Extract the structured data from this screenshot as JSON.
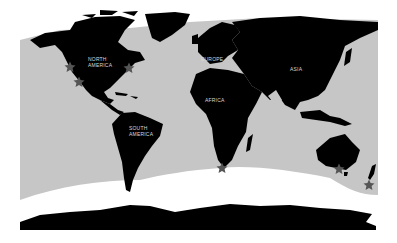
{
  "map": {
    "colors": {
      "ocean": "#c6c6c6",
      "land": "#000000",
      "ice": "#ffffff",
      "star": "#555555",
      "label": "#d8d8d8"
    },
    "labels": [
      {
        "text": "NORTH\nAMERICA",
        "x": 88,
        "y": 56
      },
      {
        "text": "EUROPE",
        "x": 201,
        "y": 56
      },
      {
        "text": "ASIA",
        "x": 290,
        "y": 66
      },
      {
        "text": "AFRICA",
        "x": 205,
        "y": 97
      },
      {
        "text": "SOUTH\nAMERICA",
        "x": 129,
        "y": 125
      }
    ],
    "markers": [
      {
        "name": "star-west-coast-north",
        "x": 70,
        "y": 67
      },
      {
        "name": "star-west-coast-south",
        "x": 79,
        "y": 82
      },
      {
        "name": "star-east-coast",
        "x": 129,
        "y": 68
      },
      {
        "name": "star-south-africa",
        "x": 222,
        "y": 168
      },
      {
        "name": "star-southeast-australia",
        "x": 339,
        "y": 169
      },
      {
        "name": "star-new-zealand",
        "x": 369,
        "y": 185
      }
    ]
  }
}
